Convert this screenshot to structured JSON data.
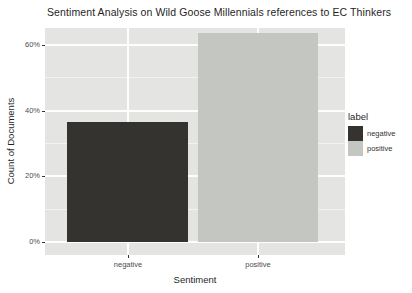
{
  "chart_data": {
    "type": "bar",
    "title": "Sentiment Analysis on Wild Goose Millennials references to EC Thinkers",
    "xlabel": "Sentiment",
    "ylabel": "Count of Documents",
    "categories": [
      "negative",
      "positive"
    ],
    "values": [
      36.4,
      63.6
    ],
    "unit": "percent",
    "y_ticks": [
      {
        "label": "0%",
        "value": 0
      },
      {
        "label": "20%",
        "value": 20
      },
      {
        "label": "40%",
        "value": 40
      },
      {
        "label": "60%",
        "value": 60
      }
    ],
    "y_minor_values": [
      10,
      30,
      50
    ],
    "ylim": [
      -3.3,
      66.9
    ],
    "grid": "white major and minor horizontal, major vertical at categories",
    "legend": {
      "title": "label",
      "position": "right",
      "entries": [
        {
          "label": "negative",
          "color": "#343330"
        },
        {
          "label": "positive",
          "color": "#c4c6c1"
        }
      ]
    },
    "colors": {
      "panel_bg": "#e4e4e2",
      "gridline": "#ffffff",
      "tick_text": "#4d4d4d",
      "title_text": "#1f1f1f",
      "tick_mark": "#333333",
      "page_bg": "#ffffff"
    }
  }
}
